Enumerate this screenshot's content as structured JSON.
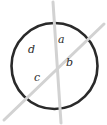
{
  "figure": {
    "background_color": "#ffffff",
    "width": 107,
    "height": 125,
    "circle": {
      "name": "circle",
      "center_x": 54.5,
      "center_y": 66,
      "radius": 43,
      "stroke_color": "#2a2a2a",
      "stroke_width": 2.6,
      "fill": "none"
    },
    "chords": [
      {
        "name": "chord-vertical",
        "x1": 53,
        "y1": 2,
        "x2": 61,
        "y2": 123,
        "stroke_color": "#d2d2d2",
        "stroke_width": 3.0
      },
      {
        "name": "chord-diagonal",
        "x1": 4,
        "y1": 120,
        "x2": 104,
        "y2": 24,
        "stroke_color": "#d2d2d2",
        "stroke_width": 3.0
      }
    ],
    "intersection": {
      "x": 56,
      "y": 60
    },
    "labels": [
      {
        "id": "a",
        "text": "a",
        "x": 58,
        "y": 40,
        "region": "top"
      },
      {
        "id": "b",
        "text": "b",
        "x": 66,
        "y": 63,
        "region": "right"
      },
      {
        "id": "c",
        "text": "c",
        "x": 34,
        "y": 78,
        "region": "bottom"
      },
      {
        "id": "d",
        "text": "d",
        "x": 28,
        "y": 50,
        "region": "left"
      }
    ]
  }
}
